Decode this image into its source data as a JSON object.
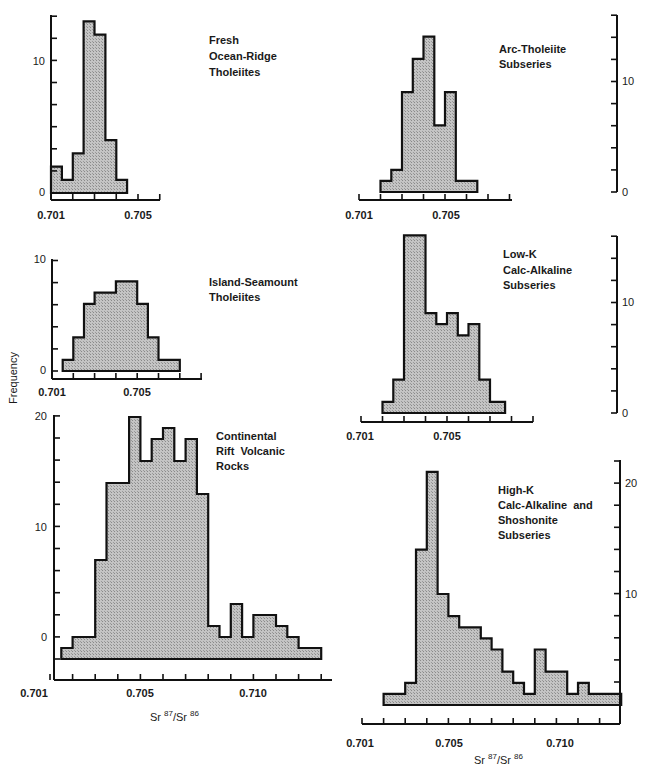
{
  "figure": {
    "y_axis_title": "Frequency",
    "x_axis_title_left": {
      "base1": "Sr ",
      "sup1": "87",
      "mid": "/Sr ",
      "sup2": "86"
    },
    "x_axis_title_right": {
      "base1": "Sr ",
      "sup1": "87",
      "mid": "/Sr ",
      "sup2": "86"
    },
    "colors": {
      "fill": "#b8b8b8",
      "stroke": "#111111",
      "background": "#ffffff"
    }
  },
  "chart_data": [
    {
      "id": "fresh-ocean-ridge-tholeiites",
      "type": "bar",
      "title_lines": [
        "Fresh",
        "Ocean-Ridge",
        "Tholeiites"
      ],
      "xlabel": "",
      "ylabel": "Frequency",
      "x_tick_labels": [
        "0.701",
        "0.705"
      ],
      "y_tick_labels": [
        "10",
        "0"
      ],
      "y_axis_side": "left",
      "xlim": [
        0.701,
        0.706
      ],
      "ylim": [
        0,
        14
      ],
      "bins": [
        [
          0.701,
          0.7015,
          2
        ],
        [
          0.7015,
          0.702,
          1
        ],
        [
          0.702,
          0.7025,
          3
        ],
        [
          0.7025,
          0.703,
          13
        ],
        [
          0.703,
          0.7035,
          12
        ],
        [
          0.7035,
          0.704,
          4
        ],
        [
          0.704,
          0.7045,
          1
        ]
      ]
    },
    {
      "id": "arc-tholeiite-subseries",
      "type": "bar",
      "title_lines": [
        "Arc-Tholeiite",
        "Subseries"
      ],
      "xlabel": "",
      "ylabel": "Frequency",
      "x_tick_labels": [
        "0.701",
        "0.705"
      ],
      "y_tick_labels": [
        "10",
        "0"
      ],
      "y_axis_side": "right",
      "xlim": [
        0.701,
        0.708
      ],
      "ylim": [
        0,
        16
      ],
      "bins": [
        [
          0.702,
          0.7025,
          1
        ],
        [
          0.7025,
          0.703,
          2
        ],
        [
          0.703,
          0.7035,
          9
        ],
        [
          0.7035,
          0.704,
          12
        ],
        [
          0.704,
          0.7045,
          14
        ],
        [
          0.7045,
          0.705,
          6
        ],
        [
          0.705,
          0.7055,
          9
        ],
        [
          0.7055,
          0.7065,
          1
        ]
      ]
    },
    {
      "id": "island-seamount-tholeiites",
      "type": "bar",
      "title_lines": [
        "Island-Seamount",
        "Tholeiites"
      ],
      "xlabel": "",
      "ylabel": "Frequency",
      "x_tick_labels": [
        "0.701",
        "0.705"
      ],
      "y_tick_labels": [
        "10",
        "0"
      ],
      "y_axis_side": "left",
      "xlim": [
        0.701,
        0.708
      ],
      "ylim": [
        0,
        10
      ],
      "bins": [
        [
          0.7015,
          0.702,
          1
        ],
        [
          0.702,
          0.7025,
          3
        ],
        [
          0.7025,
          0.703,
          6
        ],
        [
          0.703,
          0.704,
          7
        ],
        [
          0.704,
          0.705,
          8
        ],
        [
          0.705,
          0.7055,
          6
        ],
        [
          0.7055,
          0.706,
          3
        ],
        [
          0.706,
          0.707,
          1
        ]
      ]
    },
    {
      "id": "continental-rift-volcanic-rocks",
      "type": "bar",
      "title_lines": [
        "Continental",
        "Rift  Volcanic",
        "Rocks"
      ],
      "xlabel": "Sr87/Sr86",
      "ylabel": "Frequency",
      "x_tick_labels": [
        "0.701",
        "0.705",
        "0.710"
      ],
      "y_tick_labels": [
        "20",
        "10",
        "0"
      ],
      "y_axis_side": "left",
      "xlim": [
        0.701,
        0.7135
      ],
      "ylim": [
        -2,
        20
      ],
      "baseline": -2,
      "bins": [
        [
          0.7015,
          0.702,
          -1
        ],
        [
          0.702,
          0.703,
          0
        ],
        [
          0.703,
          0.7035,
          7
        ],
        [
          0.7035,
          0.7045,
          14
        ],
        [
          0.7045,
          0.705,
          20
        ],
        [
          0.705,
          0.7055,
          16
        ],
        [
          0.7055,
          0.706,
          18
        ],
        [
          0.706,
          0.7065,
          19
        ],
        [
          0.7065,
          0.707,
          16
        ],
        [
          0.707,
          0.7075,
          18
        ],
        [
          0.7075,
          0.708,
          13
        ],
        [
          0.708,
          0.7085,
          1
        ],
        [
          0.7085,
          0.709,
          0
        ],
        [
          0.709,
          0.7095,
          3
        ],
        [
          0.7095,
          0.71,
          0
        ],
        [
          0.71,
          0.711,
          2
        ],
        [
          0.711,
          0.7115,
          1
        ],
        [
          0.7115,
          0.712,
          0
        ],
        [
          0.712,
          0.713,
          -1
        ]
      ]
    },
    {
      "id": "low-k-calc-alkaline-subseries",
      "type": "bar",
      "title_lines": [
        "Low-K",
        "Calc-Alkaline",
        "Subseries"
      ],
      "xlabel": "",
      "ylabel": "Frequency",
      "x_tick_labels": [
        "0.701",
        "0.705"
      ],
      "y_tick_labels": [
        "10",
        "0"
      ],
      "y_axis_side": "right",
      "xlim": [
        0.701,
        0.709
      ],
      "ylim": [
        0,
        16
      ],
      "bins": [
        [
          0.702,
          0.7025,
          1
        ],
        [
          0.7025,
          0.703,
          3
        ],
        [
          0.703,
          0.704,
          16
        ],
        [
          0.704,
          0.7045,
          9
        ],
        [
          0.7045,
          0.705,
          8
        ],
        [
          0.705,
          0.7055,
          9
        ],
        [
          0.7055,
          0.706,
          7
        ],
        [
          0.706,
          0.7065,
          8
        ],
        [
          0.7065,
          0.707,
          3
        ],
        [
          0.707,
          0.7077,
          1
        ]
      ]
    },
    {
      "id": "high-k-calc-alkaline-shoshonite-subseries",
      "type": "bar",
      "title_lines": [
        "High-K",
        "Calc-Alkaline  and",
        "Shoshonite",
        "Subseries"
      ],
      "xlabel": "Sr87/Sr86",
      "ylabel": "Frequency",
      "x_tick_labels": [
        "0.701",
        "0.705",
        "0.710"
      ],
      "y_tick_labels": [
        "20",
        "10"
      ],
      "y_axis_side": "right",
      "xlim": [
        0.701,
        0.713
      ],
      "ylim": [
        0,
        22
      ],
      "bins": [
        [
          0.702,
          0.703,
          1
        ],
        [
          0.703,
          0.7035,
          2
        ],
        [
          0.7035,
          0.704,
          14
        ],
        [
          0.704,
          0.7045,
          21
        ],
        [
          0.7045,
          0.705,
          10
        ],
        [
          0.705,
          0.7055,
          8
        ],
        [
          0.7055,
          0.7065,
          7
        ],
        [
          0.7065,
          0.707,
          6
        ],
        [
          0.707,
          0.7075,
          5
        ],
        [
          0.7075,
          0.708,
          3
        ],
        [
          0.708,
          0.7085,
          2
        ],
        [
          0.7085,
          0.709,
          1
        ],
        [
          0.709,
          0.7095,
          5
        ],
        [
          0.7095,
          0.7105,
          3
        ],
        [
          0.7105,
          0.711,
          1
        ],
        [
          0.711,
          0.7115,
          2
        ],
        [
          0.7115,
          0.713,
          1
        ]
      ]
    }
  ]
}
